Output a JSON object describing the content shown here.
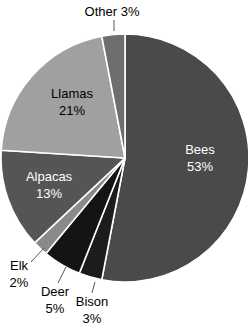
{
  "chart_data": {
    "type": "pie",
    "title": "",
    "start_angle_deg": 0,
    "direction": "clockwise",
    "categories": [
      "Bees",
      "Bison",
      "Deer",
      "Elk",
      "Alpacas",
      "Llamas",
      "Other"
    ],
    "values": [
      53,
      3,
      5,
      2,
      13,
      21,
      3
    ],
    "units": "%",
    "colors": [
      "#4a4a4a",
      "#1c1c1c",
      "#141414",
      "#8a8a8a",
      "#555555",
      "#a0a0a0",
      "#6e6e6e"
    ],
    "labels": [
      {
        "name": "Bees",
        "pct": "53%",
        "inside": true,
        "color": "#ffffff"
      },
      {
        "name": "Bison",
        "pct": "3%",
        "inside": false,
        "color": "#000000"
      },
      {
        "name": "Deer",
        "pct": "5%",
        "inside": false,
        "color": "#000000"
      },
      {
        "name": "Elk",
        "pct": "2%",
        "inside": false,
        "color": "#000000"
      },
      {
        "name": "Alpacas",
        "pct": "13%",
        "inside": true,
        "color": "#ffffff"
      },
      {
        "name": "Llamas",
        "pct": "21%",
        "inside": true,
        "color": "#000000"
      },
      {
        "name": "Other",
        "pct": "3%",
        "inside": false,
        "color": "#000000"
      }
    ],
    "legend": "none",
    "grid": false
  }
}
